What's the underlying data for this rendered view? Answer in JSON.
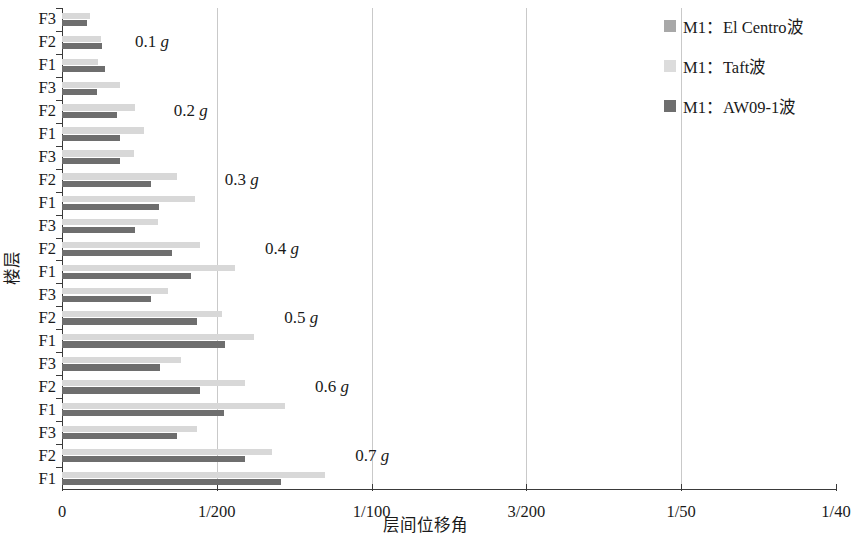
{
  "chart_data": {
    "type": "bar",
    "orientation": "horizontal",
    "title": "",
    "xlabel": "层间位移角",
    "ylabel": "楼层",
    "xlim": [
      0,
      0.025
    ],
    "xticks": [
      0,
      0.005,
      0.01,
      0.015,
      0.02,
      0.025
    ],
    "xtick_labels": [
      "0",
      "1/200",
      "1/100",
      "3/200",
      "1/50",
      "1/40"
    ],
    "grid": "vertical-only",
    "legend_position": "top-right",
    "categories": [
      "F3",
      "F2",
      "F1"
    ],
    "group_labels": [
      "0.1 g",
      "0.2 g",
      "0.3 g",
      "0.4 g",
      "0.5 g",
      "0.6 g",
      "0.7 g"
    ],
    "series": [
      {
        "name": "M1：El Centro波",
        "color": "#a8a8a8"
      },
      {
        "name": "M1：Taft波",
        "color": "#dcdcdc"
      },
      {
        "name": "M1：AW09-1波",
        "color": "#6e6e6e"
      }
    ],
    "groups": [
      {
        "label": "0.1 g",
        "floors": [
          {
            "floor": "F3",
            "values": [
              0.0,
              0.0009,
              0.00082
            ]
          },
          {
            "floor": "F2",
            "values": [
              0.0,
              0.00125,
              0.00128
            ]
          },
          {
            "floor": "F1",
            "values": [
              0.0,
              0.00116,
              0.00139
            ]
          }
        ]
      },
      {
        "label": "0.2 g",
        "floors": [
          {
            "floor": "F3",
            "values": [
              0.0,
              0.00186,
              0.00112
            ]
          },
          {
            "floor": "F2",
            "values": [
              0.0,
              0.00236,
              0.00177
            ]
          },
          {
            "floor": "F1",
            "values": [
              0.0,
              0.00264,
              0.00186
            ]
          }
        ]
      },
      {
        "label": "0.3 g",
        "floors": [
          {
            "floor": "F3",
            "values": [
              0.0,
              0.00233,
              0.00186
            ]
          },
          {
            "floor": "F2",
            "values": [
              0.0,
              0.00373,
              0.00286
            ]
          },
          {
            "floor": "F1",
            "values": [
              0.0,
              0.00429,
              0.00314
            ]
          }
        ]
      },
      {
        "label": "0.4 g",
        "floors": [
          {
            "floor": "F3",
            "values": [
              0.0,
              0.00311,
              0.00236
            ]
          },
          {
            "floor": "F2",
            "values": [
              0.0,
              0.00447,
              0.00354
            ]
          },
          {
            "floor": "F1",
            "values": [
              0.0,
              0.00559,
              0.00416
            ]
          }
        ]
      },
      {
        "label": "0.5 g",
        "floors": [
          {
            "floor": "F3",
            "values": [
              0.0,
              0.00342,
              0.00286
            ]
          },
          {
            "floor": "F2",
            "values": [
              0.0,
              0.00516,
              0.00435
            ]
          },
          {
            "floor": "F1",
            "values": [
              0.0,
              0.00621,
              0.00528
            ]
          }
        ]
      },
      {
        "label": "0.6 g",
        "floors": [
          {
            "floor": "F3",
            "values": [
              0.0,
              0.00385,
              0.00317
            ]
          },
          {
            "floor": "F2",
            "values": [
              0.0,
              0.0059,
              0.00447
            ]
          },
          {
            "floor": "F1",
            "values": [
              0.0,
              0.0072,
              0.00522
            ]
          }
        ]
      },
      {
        "label": "0.7 g",
        "floors": [
          {
            "floor": "F3",
            "values": [
              0.0,
              0.00435,
              0.00373
            ]
          },
          {
            "floor": "F2",
            "values": [
              0.0,
              0.00677,
              0.0059
            ]
          },
          {
            "floor": "F1",
            "values": [
              0.0,
              0.0085,
              0.00708
            ]
          }
        ]
      }
    ]
  },
  "legend": {
    "items": [
      {
        "label": "M1：El Centro波"
      },
      {
        "label": "M1：Taft波"
      },
      {
        "label": "M1：AW09-1波"
      }
    ]
  },
  "axes": {
    "x_title": "层间位移角",
    "y_title": "楼层"
  }
}
